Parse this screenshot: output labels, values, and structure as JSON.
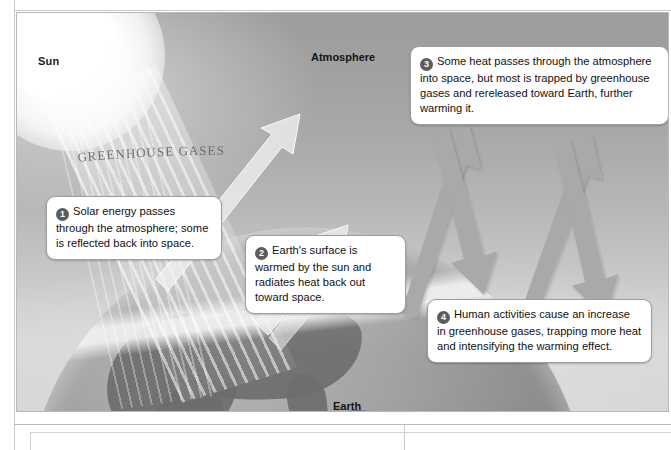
{
  "figure": {
    "labels": {
      "sun": "Sun",
      "atmosphere": "Atmosphere",
      "earth": "Earth",
      "greenhouse_gases": "GREENHOUSE GASES"
    },
    "callouts": [
      {
        "number": "1",
        "text": "Solar energy passes through the atmosphere; some is reflected back into space."
      },
      {
        "number": "2",
        "text": "Earth's surface is warmed by the sun and radiates heat back out toward space."
      },
      {
        "number": "3",
        "text": "Some heat passes through the atmosphere into space, but most is trapped by greenhouse gases and rereleased toward Earth, further warming it."
      },
      {
        "number": "4",
        "text": "Human activities cause an increase in greenhouse gases, trapping more heat and intensifying the warming effect."
      }
    ],
    "colors": {
      "sky_top": "#9d9d9d",
      "sky_bottom": "#d6d6d6",
      "earth_body": "#8e8e8e",
      "continent": "#6e6e6e",
      "arrow_gray": "#a8a8a8",
      "arrow_light": "#eaeaea",
      "badge": "#5c5c5c",
      "callout_bg": "#ffffff",
      "callout_border": "#9e9e9e",
      "label_text": "#141414"
    },
    "arrows": [
      {
        "name": "solar-ray-up-left",
        "direction": "up-right",
        "style": "outline-light"
      },
      {
        "name": "solar-ray-up-right",
        "direction": "up-right",
        "style": "outline-light"
      },
      {
        "name": "heat-escape-left",
        "direction": "up-right",
        "style": "solid-gray"
      },
      {
        "name": "heat-reflect-left",
        "direction": "down-right",
        "style": "solid-gray"
      },
      {
        "name": "heat-escape-right",
        "direction": "up-right",
        "style": "solid-gray"
      },
      {
        "name": "heat-reflect-right",
        "direction": "down-right",
        "style": "solid-gray"
      }
    ]
  }
}
